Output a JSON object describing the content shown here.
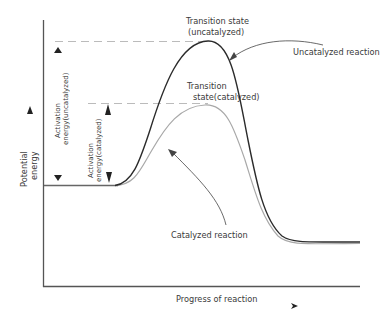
{
  "diagram": {
    "type": "energy-profile",
    "y_axis_label": [
      "Potential",
      "energy"
    ],
    "x_axis_label": "Progress of reaction",
    "annotations": {
      "ts_uncatalyzed": [
        "Transition state",
        "(uncatalyzed)"
      ],
      "ts_catalyzed": [
        "Transition",
        "state(catalyzed)"
      ],
      "uncatalyzed_reaction": "Uncatalyzed reaction",
      "catalyzed_reaction": "Catalyzed reaction",
      "activation_uncatalyzed": [
        "Activation",
        "energy(uncatalyzed)"
      ],
      "activation_catalyzed": [
        "Activation",
        "energy(catalyzed)"
      ]
    },
    "series": [
      {
        "name": "Uncatalyzed reaction",
        "color": "#2b2b2b",
        "relative_peak": 1.0
      },
      {
        "name": "Catalyzed reaction",
        "color": "#a8a8a8",
        "relative_peak": 0.55
      }
    ],
    "levels": {
      "reactants": 0.0,
      "products": -0.39,
      "ts_uncatalyzed": 1.0,
      "ts_catalyzed": 0.55
    },
    "colors": {
      "axis": "#555555",
      "dashed": "#aaaaaa",
      "text": "#3a3a3a"
    }
  }
}
